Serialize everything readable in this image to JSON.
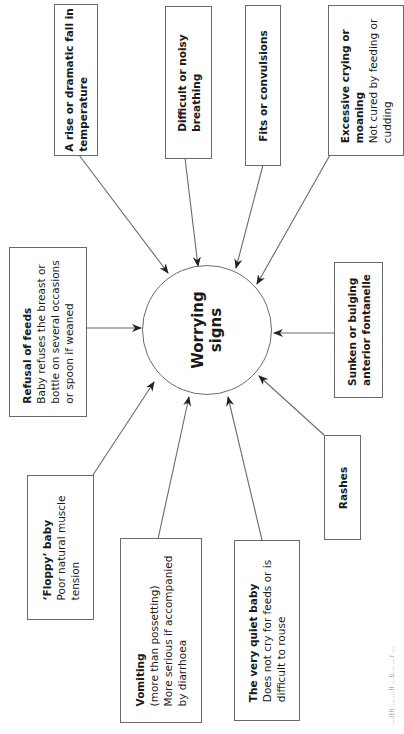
{
  "diagram": {
    "center": {
      "line1": "Worrying",
      "line2": "signs"
    },
    "nodes": [
      {
        "id": "temperature",
        "title": "A rise or dramatic fall in",
        "desc": "temperature",
        "title_bold_all": true
      },
      {
        "id": "breathing",
        "title": "Difficult or noisy",
        "desc": "breathing",
        "title_bold_all": true
      },
      {
        "id": "fits",
        "title": "Fits or convulsions",
        "desc": ""
      },
      {
        "id": "crying",
        "title": "Excessive crying or",
        "title2": "moaning",
        "desc": "Not cured by feeding or",
        "desc2": "cudding"
      },
      {
        "id": "fontanelle",
        "title": "Sunken or bulging",
        "desc": "anterior fontanelle"
      },
      {
        "id": "rashes",
        "title": "Rashes",
        "desc": ""
      },
      {
        "id": "quiet",
        "title": "The very quiet baby",
        "desc": "Does not cry for feeds or is",
        "desc2": "difficult to rouse"
      },
      {
        "id": "vomiting",
        "title": "Vomiting",
        "desc": "(more than possetting)",
        "desc2": "More serious if accompanied",
        "desc3": "by diarrhoea"
      },
      {
        "id": "floppy",
        "title": "‘Floppy’ baby",
        "desc": "Poor natural muscle",
        "desc2": "tension"
      },
      {
        "id": "refusal",
        "title": "Refusal of feeds",
        "desc": "Baby refuses the breast or",
        "desc2": "bottle on several occasions",
        "desc3": "or spoon if weaned"
      }
    ],
    "edges": [
      {
        "from": "temperature",
        "to": "center"
      },
      {
        "from": "breathing",
        "to": "center"
      },
      {
        "from": "fits",
        "to": "center"
      },
      {
        "from": "crying",
        "to": "center"
      },
      {
        "from": "fontanelle",
        "to": "center"
      },
      {
        "from": "rashes",
        "to": "center"
      },
      {
        "from": "quiet",
        "to": "center"
      },
      {
        "from": "vomiting",
        "to": "center"
      },
      {
        "from": "floppy",
        "to": "center"
      },
      {
        "from": "refusal",
        "to": "center"
      }
    ],
    "orientation": "rotated 90° counter-clockwise",
    "caption_fragment": "...ith ... ...ll ...b... ...r ..."
  },
  "colors": {
    "line": "#6a6a6a",
    "text": "#1a1a1a",
    "background": "#ffffff"
  }
}
